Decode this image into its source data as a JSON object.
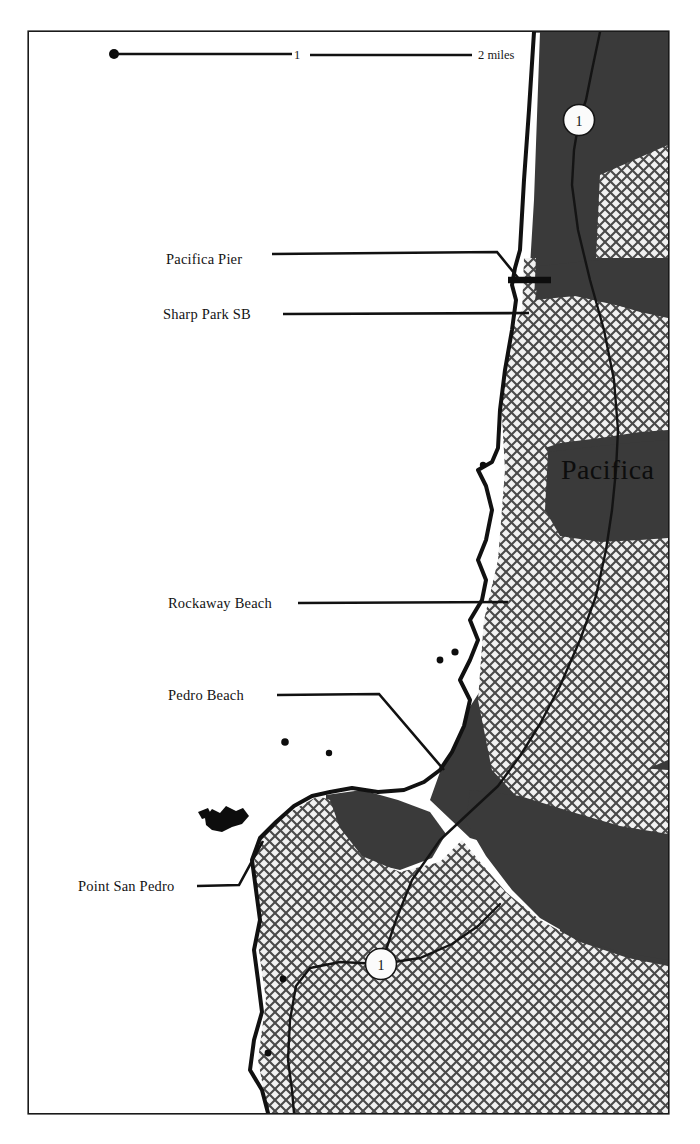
{
  "map": {
    "title": "Pacifica coastline map",
    "background_color": "#ffffff",
    "ocean_color": "#ffffff",
    "urban_fill_color": "#e8e8e8",
    "park_fill_color": "#3a3a3a",
    "ink_color": "#111111",
    "frame": {
      "x": 28,
      "y": 31,
      "width": 641,
      "height": 1083
    },
    "scale_bar": {
      "name": "scale-bar",
      "labels": [
        "1",
        "2 miles"
      ],
      "tick_values": [
        0,
        1,
        2
      ],
      "unit": "miles",
      "x_start": 112,
      "x_end": 480
    },
    "city_label": {
      "text": "Pacifica",
      "x": 561,
      "y": 478
    },
    "place_labels": [
      {
        "id": "pacifica-pier",
        "text": "Pacifica Pier",
        "text_x": 166,
        "text_y": 259,
        "leader": "M 272 254 L 497 252 L 519 279"
      },
      {
        "id": "sharp-park-sb",
        "text": "Sharp Park SB",
        "text_x": 163,
        "text_y": 319,
        "leader": "M 283 314 L 528 313"
      },
      {
        "id": "rockaway-beach",
        "text": "Rockaway Beach",
        "text_x": 168,
        "text_y": 608,
        "leader": "M 297 603 L 507 602"
      },
      {
        "id": "pedro-beach",
        "text": "Pedro Beach",
        "text_x": 168,
        "text_y": 699,
        "leader": "M 277 695 L 379 694 L 444 769"
      },
      {
        "id": "point-san-pedro",
        "text": "Point San Pedro",
        "text_x": 78,
        "text_y": 891,
        "leader": "M 197 886 L 239 885 L 262 842"
      }
    ],
    "highway_shields": [
      {
        "id": "highway-1-north",
        "label": "1",
        "cx": 579,
        "cy": 120,
        "r": 15
      },
      {
        "id": "highway-1-south",
        "label": "1",
        "cx": 381,
        "cy": 964,
        "r": 15
      }
    ],
    "offshore_rocks": [
      {
        "cx": 483,
        "cy": 465,
        "r": 3.2
      },
      {
        "cx": 440,
        "cy": 659,
        "r": 3.4
      },
      {
        "cx": 454,
        "cy": 652,
        "r": 3.6
      },
      {
        "cx": 285,
        "cy": 742,
        "r": 3.6
      },
      {
        "cx": 329,
        "cy": 753,
        "r": 3.2
      },
      {
        "cx": 283,
        "cy": 979,
        "r": 3.4
      },
      {
        "cx": 268,
        "cy": 1053,
        "r": 3.4
      }
    ],
    "rock_outcrop": {
      "id": "san-pedro-rock",
      "cx": 224,
      "cy": 820
    },
    "pier": {
      "id": "pacifica-pier-structure",
      "x1": 516,
      "y1": 280,
      "x2": 549,
      "y2": 280
    }
  }
}
